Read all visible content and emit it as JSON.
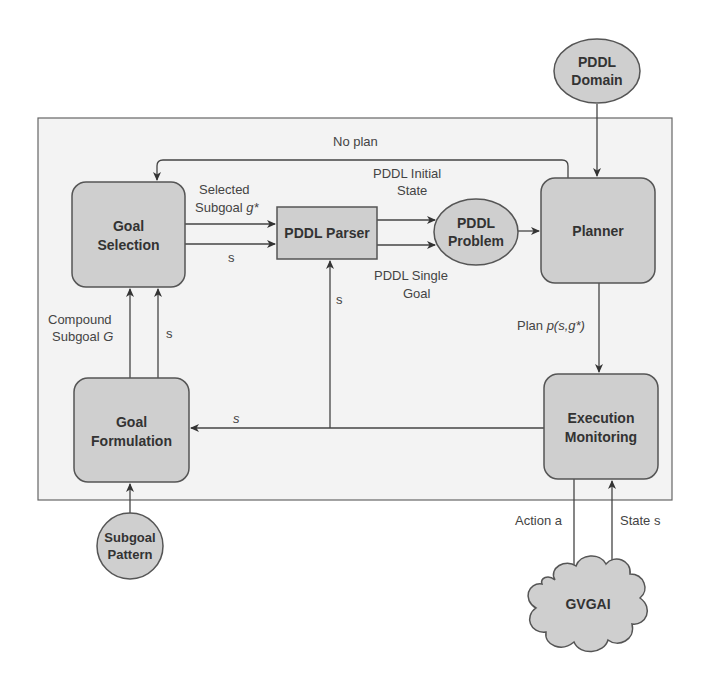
{
  "diagram": {
    "nodes": {
      "goal_selection": {
        "line1": "Goal",
        "line2": "Selection"
      },
      "pddl_parser": {
        "label": "PDDL Parser"
      },
      "pddl_problem": {
        "line1": "PDDL",
        "line2": "Problem"
      },
      "planner": {
        "label": "Planner"
      },
      "pddl_domain": {
        "line1": "PDDL",
        "line2": "Domain"
      },
      "goal_formulation": {
        "line1": "Goal",
        "line2": "Formulation"
      },
      "execution_monitoring": {
        "line1": "Execution",
        "line2": "Monitoring"
      },
      "subgoal_pattern": {
        "line1": "Subgoal",
        "line2": "Pattern"
      },
      "gvgai": {
        "label": "GVGAI"
      }
    },
    "edges": {
      "no_plan": "No plan",
      "selected_subgoal_line1": "Selected",
      "selected_subgoal_line2": "Subgoal ",
      "selected_subgoal_var": "g*",
      "s_to_parser": "s",
      "pddl_initial_state_line1": "PDDL Initial",
      "pddl_initial_state_line2": "State",
      "pddl_single_goal_line1": "PDDL Single",
      "pddl_single_goal_line2": "Goal",
      "s_up_parser": "s",
      "compound_subgoal_line1": "Compound",
      "compound_subgoal_line2": "Subgoal ",
      "compound_subgoal_var": "G",
      "s_up_selection": "s",
      "s_to_formulation": "s",
      "plan_prefix": "Plan ",
      "plan_var": "p(s,g*)",
      "action": "Action a",
      "state": "State s"
    }
  }
}
